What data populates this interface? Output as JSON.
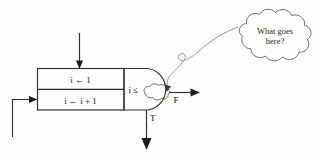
{
  "figure": {
    "kind": "flowchart-fragment",
    "background_color": "#fdfdfc",
    "line_color": "#2e2e2e"
  },
  "process_box": {
    "rows": [
      {
        "id": "init",
        "text": "i ← 1"
      },
      {
        "id": "increment",
        "text": "i ← i + 1"
      }
    ]
  },
  "decision": {
    "text": "i ≤",
    "placeholder_icon": "scribble-cloud-icon",
    "true_label": "T",
    "false_label": "F"
  },
  "annotation": {
    "icon": "thought-cloud-icon",
    "line_1": "What goes",
    "line_2": "here?",
    "pointer_icon": "curly-pointer-icon"
  },
  "arrows": {
    "entry_top": "entry-arrow-icon",
    "loop_back": "loop-back-arrow-icon",
    "exit_false": "false-exit-arrow-icon",
    "exit_true": "true-exit-arrow-icon"
  }
}
